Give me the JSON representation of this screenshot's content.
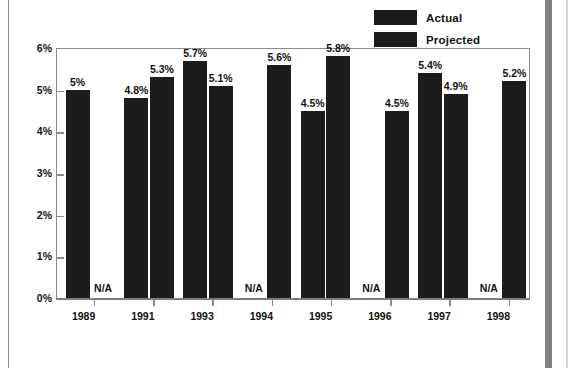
{
  "legend": {
    "position": "top-right",
    "entries": [
      {
        "label": "Actual",
        "color": "#1a1a1a",
        "swatch_name": "legend-swatch-actual"
      },
      {
        "label": "Projected",
        "color": "#1a1a1a",
        "swatch_name": "legend-swatch-projected"
      }
    ]
  },
  "na_text": "N/A",
  "chart_data": {
    "type": "bar",
    "title": "",
    "subtitle": "",
    "xlabel": "",
    "ylabel": "",
    "ylim": [
      0,
      6
    ],
    "grid": false,
    "y_ticks": [
      0,
      1,
      2,
      3,
      4,
      5,
      6
    ],
    "y_tick_labels": [
      "0%",
      "1%",
      "2%",
      "3%",
      "4%",
      "5%",
      "6%"
    ],
    "categories": [
      "1989",
      "1991",
      "1993",
      "1994",
      "1995",
      "1996",
      "1997",
      "1998"
    ],
    "series": [
      {
        "name": "Actual",
        "color": "#1c1c1c",
        "values": [
          5.0,
          4.8,
          5.7,
          null,
          4.5,
          null,
          5.4,
          null
        ],
        "labels": [
          "5%",
          "4.8%",
          "5.7%",
          "N/A",
          "4.5%",
          "N/A",
          "5.4%",
          "N/A"
        ]
      },
      {
        "name": "Projected",
        "color": "#1c1c1c",
        "values": [
          null,
          5.3,
          5.1,
          5.6,
          5.8,
          4.5,
          4.9,
          5.2
        ],
        "labels": [
          "N/A",
          "5.3%",
          "5.1%",
          "5.6%",
          "5.8%",
          "4.5%",
          "4.9%",
          "5.2%"
        ]
      }
    ]
  }
}
